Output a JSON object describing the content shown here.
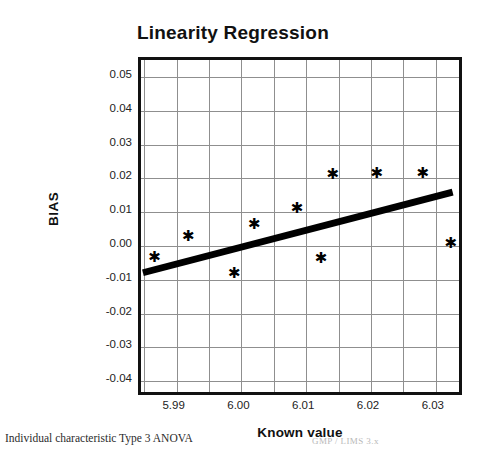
{
  "chart_data": {
    "type": "scatter",
    "title": "Linearity Regression",
    "xlabel": "Known value",
    "ylabel": "BIAS",
    "xlim": [
      5.9845,
      6.0345
    ],
    "ylim": [
      -0.045,
      0.055
    ],
    "grid": true,
    "legend": null,
    "xticks": [
      "5.99",
      "6.00",
      "6.01",
      "6.02",
      "6.03"
    ],
    "xtick_values": [
      5.99,
      6.0,
      6.01,
      6.02,
      6.03
    ],
    "yticks": [
      "0.05",
      "0.04",
      "0.03",
      "0.02",
      "0.01",
      "0.00",
      "-0.01",
      "-0.02",
      "-0.03",
      "-0.04"
    ],
    "ytick_values": [
      0.05,
      0.04,
      0.03,
      0.02,
      0.01,
      0.0,
      -0.01,
      -0.02,
      -0.03,
      -0.04
    ],
    "marker": "star",
    "points": [
      {
        "x": 5.9866,
        "y": -0.0035
      },
      {
        "x": 5.9918,
        "y": 0.0026
      },
      {
        "x": 5.9989,
        "y": -0.0082
      },
      {
        "x": 6.002,
        "y": 0.0063
      },
      {
        "x": 6.0086,
        "y": 0.0109
      },
      {
        "x": 6.0123,
        "y": -0.004
      },
      {
        "x": 6.0141,
        "y": 0.021
      },
      {
        "x": 6.0209,
        "y": 0.0212
      },
      {
        "x": 6.028,
        "y": 0.0213
      },
      {
        "x": 6.0323,
        "y": 0.0006
      }
    ],
    "fit_line": {
      "name": "regression line",
      "x_start": 5.9848,
      "y_start": -0.0091,
      "x_end": 6.0335,
      "y_end": 0.0152,
      "color": "#000000",
      "width_px": 7
    }
  },
  "footer": {
    "left": "Individual characteristic Type 3 ANOVA",
    "right": "GMP / LIMS 3.x"
  }
}
